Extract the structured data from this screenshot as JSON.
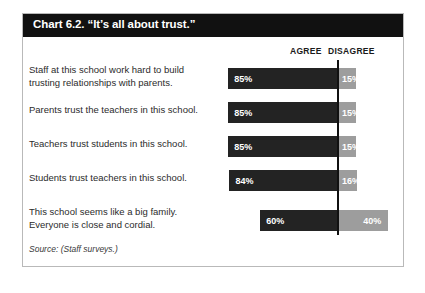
{
  "chart": {
    "title": "Chart 6.2. “It’s all about trust.”",
    "source_note": "Source: (Staff surveys.)",
    "header_agree": "AGREE",
    "header_disagree": "DISAGREE"
  },
  "chart_data": {
    "type": "bar",
    "title": "Chart 6.2. “It’s all about trust.”",
    "subtitle": "",
    "xlabel": "",
    "ylabel": "",
    "orientation": "horizontal",
    "stacked": true,
    "grid": false,
    "legend_position": "top-right",
    "xlim": [
      0,
      100
    ],
    "colors": {
      "agree": "#232323",
      "disagree": "#9d9d9d"
    },
    "categories": [
      "Staff at this school work hard to build trusting relationships with parents.",
      "Parents trust the teachers in this school.",
      "Teachers trust students in this school.",
      "Students trust teachers in this school.",
      "This school seems like a big family. Everyone is close and cordial."
    ],
    "series": [
      {
        "name": "AGREE",
        "values": [
          85,
          85,
          85,
          84,
          60
        ]
      },
      {
        "name": "DISAGREE",
        "values": [
          15,
          15,
          15,
          16,
          40
        ]
      }
    ],
    "rows": [
      {
        "label_line1": "Staff at this school work hard to build",
        "label_line2": "trusting relationships with parents.",
        "agree": 85,
        "disagree": 15,
        "agree_label": "85%",
        "disagree_label": "15%"
      },
      {
        "label_line1": "Parents trust the teachers in this school.",
        "label_line2": "",
        "agree": 85,
        "disagree": 15,
        "agree_label": "85%",
        "disagree_label": "15%"
      },
      {
        "label_line1": "Teachers trust students in this school.",
        "label_line2": "",
        "agree": 85,
        "disagree": 15,
        "agree_label": "85%",
        "disagree_label": "15%"
      },
      {
        "label_line1": "Students trust teachers in this school.",
        "label_line2": "",
        "agree": 84,
        "disagree": 16,
        "agree_label": "84%",
        "disagree_label": "16%"
      },
      {
        "label_line1": "This school seems like a big family.",
        "label_line2": "Everyone is close and cordial.",
        "agree": 60,
        "disagree": 40,
        "agree_label": "60%",
        "disagree_label": "40%"
      }
    ]
  }
}
